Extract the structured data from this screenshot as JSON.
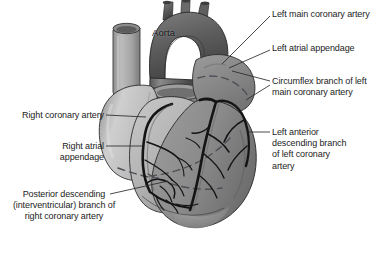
{
  "figure": {
    "background_color": "#ffffff",
    "text_color": "#1c1c1c",
    "leader_line_color": "#2a2a2a",
    "artery_color": "#151515",
    "tones": {
      "aorta_dark": "#6f6f6f",
      "aorta_shadow": "#4d4d4d",
      "pulmonary_trunk": "#9a9a9a",
      "svc_light": "#b4b4b4",
      "right_atrium": "#c3c3c3",
      "right_ventricle": "#b0b0b0",
      "left_ventricle": "#8e8e8e",
      "left_atrial_appendage": "#8a8a8a",
      "outline": "#3a3a3a",
      "dashed_groove": "#55555e"
    }
  },
  "embedded_labels": [
    {
      "id": "aorta",
      "text": "Aorta",
      "x": 152,
      "y": 27
    }
  ],
  "callouts": [
    {
      "id": "left-main-coronary-artery",
      "side": "right",
      "lines": [
        "Left main",
        "coronary artery"
      ],
      "text": "Left main coronary artery",
      "x": 272,
      "y": 9,
      "leader": {
        "x1": 270,
        "y1": 16,
        "x2": 222,
        "y2": 64
      }
    },
    {
      "id": "left-atrial-appendage",
      "side": "right",
      "lines": [
        "Left atrial",
        "appendage"
      ],
      "text": "Left atrial appendage",
      "x": 272,
      "y": 43,
      "leader": {
        "x1": 270,
        "y1": 50,
        "x2": 229,
        "y2": 68
      }
    },
    {
      "id": "circumflex-branch",
      "side": "right",
      "lines": [
        "Circumflex branch",
        "of left main coronary",
        "artery"
      ],
      "text": "Circumflex branch of left main coronary artery",
      "x": 272,
      "y": 76,
      "leader": {
        "x1": 270,
        "y1": 81,
        "x2": 232,
        "y2": 71
      },
      "leader2": {
        "x1": 270,
        "y1": 85,
        "x2": 246,
        "y2": 100
      }
    },
    {
      "id": "left-anterior-descending-branch",
      "side": "right",
      "lines": [
        "Left anterior",
        "descending",
        "branch of left",
        "coronary artery"
      ],
      "text": "Left anterior descending branch of left coronary artery",
      "x": 272,
      "y": 127,
      "leader": {
        "x1": 270,
        "y1": 132,
        "x2": 247,
        "y2": 132
      }
    },
    {
      "id": "right-coronary-artery",
      "side": "left",
      "lines": [
        "Right coronary",
        "artery"
      ],
      "text": "Right coronary artery",
      "x": 16,
      "y": 110,
      "width": 88,
      "leader": {
        "x1": 106,
        "y1": 115,
        "x2": 146,
        "y2": 117
      }
    },
    {
      "id": "right-atrial-appendage",
      "side": "left",
      "lines": [
        "Right atrial",
        "appendage"
      ],
      "text": "Right atrial appendage",
      "x": 16,
      "y": 141,
      "width": 88,
      "leader": {
        "x1": 106,
        "y1": 146,
        "x2": 142,
        "y2": 146
      }
    },
    {
      "id": "posterior-descending-branch",
      "side": "center",
      "lines": [
        "Posterior",
        "descending",
        "(interventricular)",
        "branch of right",
        "coronary artery"
      ],
      "text": "Posterior descending (interventricular) branch of right coronary artery",
      "x": 8,
      "y": 189,
      "width": 112,
      "leader": {
        "x1": 110,
        "y1": 194,
        "x2": 168,
        "y2": 181
      }
    }
  ]
}
